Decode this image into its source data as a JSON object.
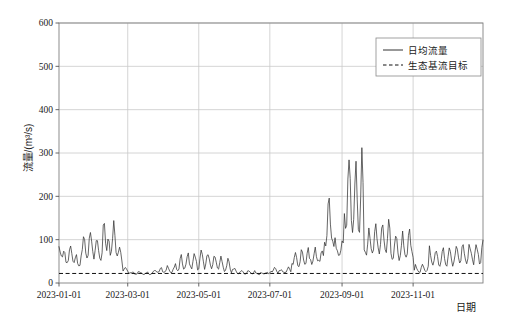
{
  "chart_data": {
    "type": "line",
    "title": "",
    "xlabel": "日期",
    "ylabel": "流量/(m³/s)",
    "ylim": [
      0,
      600
    ],
    "yticks": [
      0,
      100,
      200,
      300,
      400,
      500,
      600
    ],
    "ytick_labels": [
      "0",
      "100",
      "200",
      "300",
      "400",
      "500",
      "600"
    ],
    "xlim": [
      "2023-01-01",
      "2023-12-31"
    ],
    "xticks": [
      "2023-01-01",
      "2023-03-01",
      "2023-05-01",
      "2023-07-01",
      "2023-09-01",
      "2023-11-01"
    ],
    "xtick_labels": [
      "2023-01-01",
      "2023-03-01",
      "2023-05-01",
      "2023-07-01",
      "2023-09-01",
      "2023-11-01"
    ],
    "grid": true,
    "legend_position": "top-right",
    "legend": [
      {
        "name": "日均流量",
        "style": "solid",
        "color": "#333333"
      },
      {
        "name": "生态基流目标",
        "style": "dashed",
        "color": "#111111"
      }
    ],
    "series": [
      {
        "name": "日均流量",
        "style": "solid",
        "color": "#333333",
        "x_start": "2023-01-01",
        "x_step_days": 1,
        "values": [
          88,
          74,
          62,
          58,
          66,
          79,
          55,
          44,
          52,
          70,
          92,
          74,
          50,
          41,
          48,
          62,
          58,
          44,
          38,
          46,
          60,
          86,
          112,
          95,
          70,
          58,
          66,
          92,
          118,
          96,
          72,
          55,
          63,
          88,
          108,
          90,
          66,
          52,
          58,
          75,
          160,
          120,
          92,
          76,
          104,
          86,
          64,
          80,
          112,
          132,
          100,
          76,
          58,
          68,
          90,
          70,
          52,
          44,
          56,
          72,
          64,
          40,
          30,
          26,
          24,
          28,
          30,
          26,
          22,
          24,
          28,
          32,
          30,
          26,
          22,
          20,
          24,
          30,
          36,
          30,
          24,
          20,
          22,
          30,
          44,
          58,
          48,
          34,
          26,
          30,
          44,
          62,
          50,
          36,
          28,
          34,
          52,
          72,
          56,
          40,
          30,
          36,
          56,
          78,
          60,
          42,
          30,
          36,
          58,
          86,
          66,
          46,
          32,
          38,
          60,
          90,
          70,
          48,
          34,
          40,
          64,
          96,
          74,
          52,
          36,
          42,
          66,
          100,
          78,
          54,
          38,
          44,
          68,
          92,
          70,
          48,
          34,
          40,
          58,
          80,
          62,
          44,
          32,
          38,
          56,
          78,
          60,
          42,
          30,
          34,
          50,
          70,
          54,
          38,
          28,
          32,
          48,
          66,
          52,
          36,
          26,
          30,
          44,
          60,
          48,
          34,
          26,
          28,
          38,
          50,
          40,
          30,
          24,
          26,
          34,
          44,
          36,
          28,
          22,
          24,
          30,
          38,
          32,
          26,
          22,
          24,
          28,
          34,
          30,
          24,
          20,
          22,
          26,
          30,
          26,
          22,
          20,
          21,
          24,
          28,
          24,
          21,
          20,
          22,
          26,
          30,
          26,
          22,
          20,
          22,
          28,
          36,
          30,
          24,
          20,
          22,
          30,
          42,
          34,
          26,
          21,
          24,
          34,
          48,
          38,
          28,
          22,
          26,
          40,
          56,
          44,
          32,
          24,
          28,
          44,
          64,
          50,
          36,
          26,
          30,
          48,
          70,
          54,
          38,
          28,
          32,
          52,
          76,
          58,
          40,
          30,
          34,
          56,
          82,
          62,
          44,
          32,
          36,
          60,
          88,
          68,
          48,
          34,
          38,
          64,
          94,
          72,
          50,
          36,
          40,
          68,
          100,
          76,
          54,
          38,
          44,
          72,
          106,
          80,
          56,
          40,
          46,
          76,
          110,
          84,
          58,
          42,
          48,
          80,
          116,
          88,
          62,
          44,
          50,
          84,
          120,
          92,
          64,
          46,
          52,
          88,
          126,
          96,
          68,
          48,
          54,
          92,
          130,
          100,
          70,
          50,
          56,
          96,
          136,
          104,
          74,
          52,
          58,
          100,
          140,
          108,
          76,
          54,
          60,
          104,
          146,
          112,
          80,
          56,
          62,
          108,
          150,
          116,
          82,
          58,
          64,
          112,
          156,
          120,
          84,
          60,
          66,
          116,
          160,
          124,
          88,
          62,
          68,
          120,
          166,
          128,
          90,
          64,
          70,
          124,
          170,
          132,
          94,
          66,
          72,
          128,
          176,
          136,
          96,
          68,
          74,
          132,
          180,
          140,
          100,
          70,
          76,
          136,
          186,
          144,
          102,
          72,
          78,
          140,
          190
        ],
        "notes": "Daily mean discharge; highly variable with winter base ~20-100, spring low ~20-40, summer rising from July, major flood peaks in August (max ~555) and mid-August (~500), receding through autumn to ~20-140 in Nov-Dec.",
        "peak_max": 555,
        "peak_max_date": "2023-08-22",
        "secondary_peaks": [
          500,
          490,
          440,
          270
        ]
      },
      {
        "name": "生态基流目标",
        "style": "dashed",
        "color": "#111111",
        "constant_value": 22,
        "notes": "Horizontal dashed ecological base-flow target line at approximately 22 m³/s"
      }
    ]
  },
  "axes": {
    "y_axis_title": "流量/(m³/s)",
    "x_axis_title": "日期"
  },
  "legend": {
    "items": [
      {
        "label": "日均流量",
        "style": "solid"
      },
      {
        "label": "生态基流目标",
        "style": "dashed"
      }
    ]
  },
  "colors": {
    "line": "#333333",
    "baseflow": "#111111",
    "grid": "#c9c9c9",
    "axis": "#808080",
    "background": "#ffffff",
    "text": "#1a1a1a"
  }
}
